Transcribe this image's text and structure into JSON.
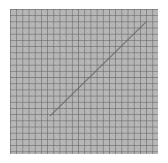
{
  "image": {
    "subject": "gray grid pattern swatch",
    "background_color": "#ffffff",
    "grid_fill_color": "#b4b4b4",
    "grid_line_color": "#5a5a5a",
    "grid_cells_approx": 24,
    "diagonal_line": {
      "color": "#6a6a6a",
      "from": [
        50,
        116
      ],
      "to": [
        146,
        22
      ]
    }
  }
}
